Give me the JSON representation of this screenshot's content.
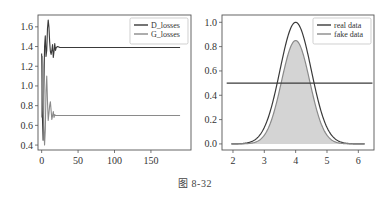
{
  "caption": "图 8-32",
  "chart_data": [
    {
      "type": "line",
      "title": "",
      "xlabel": "",
      "ylabel": "",
      "xlim": [
        -5,
        205
      ],
      "ylim": [
        0.35,
        1.72
      ],
      "xticks": [
        0,
        50,
        100,
        150
      ],
      "yticks": [
        0.4,
        0.6,
        0.8,
        1.0,
        1.2,
        1.4,
        1.6
      ],
      "ytick_labels": [
        "0.4",
        "0.6",
        "0.8",
        "1.0",
        "1.2",
        "1.4",
        "1.6"
      ],
      "grid": false,
      "legend_position": "upper right",
      "series": [
        {
          "name": "D_losses",
          "color": "#3a3a3a",
          "x": [
            0,
            1,
            2,
            3,
            4,
            5,
            6,
            7,
            8,
            9,
            10,
            11,
            12,
            13,
            14,
            15,
            16,
            17,
            18,
            19,
            20,
            22,
            25,
            30,
            190
          ],
          "y": [
            1.33,
            0.7,
            0.45,
            0.95,
            1.4,
            1.51,
            1.3,
            1.36,
            1.58,
            1.67,
            1.6,
            1.45,
            1.35,
            1.32,
            1.36,
            1.42,
            1.29,
            1.35,
            1.43,
            1.36,
            1.39,
            1.4,
            1.39,
            1.39,
            1.39
          ]
        },
        {
          "name": "G_losses",
          "color": "#8a8a8a",
          "x": [
            0,
            1,
            2,
            3,
            4,
            5,
            6,
            7,
            8,
            9,
            10,
            11,
            12,
            13,
            14,
            15,
            16,
            17,
            18,
            19,
            20,
            22,
            25,
            30,
            190
          ],
          "y": [
            0.68,
            1.3,
            1.2,
            0.6,
            0.4,
            0.55,
            0.95,
            1.1,
            0.85,
            0.65,
            0.72,
            0.8,
            0.84,
            0.75,
            0.66,
            0.7,
            0.74,
            0.68,
            0.71,
            0.7,
            0.7,
            0.7,
            0.7,
            0.7,
            0.7
          ]
        }
      ]
    },
    {
      "type": "area",
      "title": "",
      "xlabel": "",
      "ylabel": "",
      "xlim": [
        1.65,
        6.5
      ],
      "ylim": [
        -0.05,
        1.06
      ],
      "xticks": [
        2,
        3,
        4,
        5,
        6
      ],
      "yticks": [
        0.0,
        0.2,
        0.4,
        0.6,
        0.8,
        1.0
      ],
      "ytick_labels": [
        "0.0",
        "0.2",
        "0.4",
        "0.6",
        "0.8",
        "1.0"
      ],
      "grid": false,
      "legend_position": "upper right",
      "series": [
        {
          "name": "real data",
          "color": "#3a3a3a",
          "kind": "gaussian",
          "mean": 4.0,
          "std": 0.5,
          "peak": 1.0,
          "x_range": [
            1.95,
            6.2
          ]
        },
        {
          "name": "fake data",
          "color": "#8a8a8a",
          "fill": "#d4d4d4",
          "kind": "gaussian",
          "mean": 4.0,
          "std": 0.45,
          "peak": 0.85,
          "x_range": [
            1.95,
            6.2
          ]
        },
        {
          "name": "decision boundary",
          "color": "#3a3a3a",
          "kind": "hline",
          "y": 0.5,
          "x_range": [
            1.8,
            6.45
          ],
          "in_legend": false
        }
      ]
    }
  ]
}
